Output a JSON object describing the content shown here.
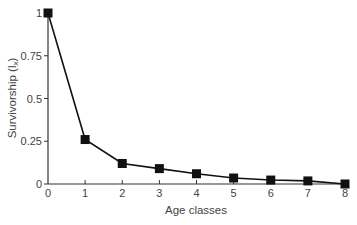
{
  "chart_data": {
    "type": "line",
    "title": "",
    "xlabel": "Age classes",
    "ylabel": "Survivorship (l",
    "ylabel_subscript": "x",
    "ylabel_close": ")",
    "x": [
      0,
      1,
      2,
      3,
      4,
      5,
      6,
      7,
      8
    ],
    "series": [
      {
        "name": "Survivorship",
        "values": [
          1.0,
          0.26,
          0.12,
          0.09,
          0.06,
          0.035,
          0.023,
          0.018,
          0.0
        ],
        "marker": "square",
        "color": "#111111"
      }
    ],
    "x_ticks": [
      "0",
      "1",
      "2",
      "3",
      "4",
      "5",
      "6",
      "7",
      "8"
    ],
    "y_ticks": [
      "0",
      "0.25",
      "0.5",
      "0.75",
      "1"
    ],
    "y_tick_values": [
      0,
      0.25,
      0.5,
      0.75,
      1
    ],
    "xlim": [
      0,
      8
    ],
    "ylim": [
      0,
      1
    ],
    "grid": false,
    "legend": "none"
  }
}
